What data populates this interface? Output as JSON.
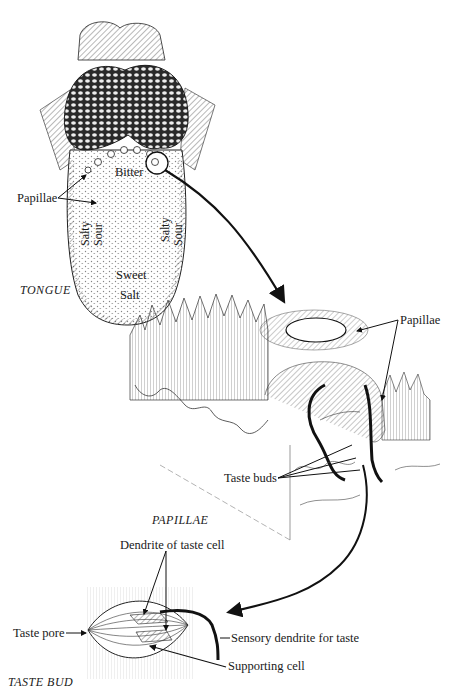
{
  "figure": {
    "panels": [
      {
        "id": "tongue",
        "caption": "TONGUE",
        "labels": {
          "papillae": "Papillae",
          "bitter": "Bitter",
          "salty_left": "Salty",
          "sour_left": "Sour",
          "salty_right": "Salty",
          "sour_right": "Sour",
          "sweet": "Sweet",
          "salt": "Salt"
        }
      },
      {
        "id": "papillae",
        "caption": "PAPILLAE",
        "labels": {
          "papillae": "Papillae",
          "taste_buds": "Taste buds"
        }
      },
      {
        "id": "taste_bud",
        "caption": "TASTE BUD",
        "labels": {
          "dendrite_of_taste_cell": "Dendrite of taste cell",
          "taste_pore": "Taste pore",
          "sensory_dendrite": "Sensory dendrite for taste",
          "supporting_cell": "Supporting cell"
        }
      }
    ],
    "colors": {
      "ink": "#1a1a1a",
      "background": "#ffffff"
    }
  }
}
